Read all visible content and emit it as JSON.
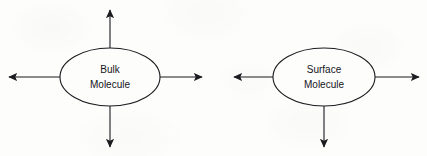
{
  "figure": {
    "kind": "molecular-force-balance-diagram",
    "background_color": "#fdfdfc",
    "stroke_color": "#1b1b20",
    "text_color": "#15151a",
    "stroke_width": 1.1,
    "diagrams": [
      {
        "id": "bulk",
        "name": "bulk-molecule-diagram",
        "ellipse": {
          "cx": 110,
          "cy": 77,
          "rx": 50,
          "ry": 29
        },
        "label_lines": [
          "Bulk",
          "Molecule"
        ],
        "arrow_count": 4,
        "arrows": [
          {
            "name": "arrow-up",
            "direction": "up",
            "x1": 110,
            "y1": 48,
            "x2": 110,
            "y2": 10
          },
          {
            "name": "arrow-right",
            "direction": "right",
            "x1": 160,
            "y1": 77,
            "x2": 202,
            "y2": 77
          },
          {
            "name": "arrow-down",
            "direction": "down",
            "x1": 110,
            "y1": 106,
            "x2": 110,
            "y2": 147
          },
          {
            "name": "arrow-left",
            "direction": "left",
            "x1": 60,
            "y1": 77,
            "x2": 9,
            "y2": 77
          }
        ]
      },
      {
        "id": "surface",
        "name": "surface-molecule-diagram",
        "ellipse": {
          "cx": 324,
          "cy": 77,
          "rx": 51,
          "ry": 29
        },
        "label_lines": [
          "Surface",
          "Molecule"
        ],
        "arrow_count": 3,
        "arrows": [
          {
            "name": "arrow-right",
            "direction": "right",
            "x1": 375,
            "y1": 77,
            "x2": 419,
            "y2": 77
          },
          {
            "name": "arrow-down",
            "direction": "down",
            "x1": 324,
            "y1": 106,
            "x2": 324,
            "y2": 147
          },
          {
            "name": "arrow-left",
            "direction": "left",
            "x1": 273,
            "y1": 77,
            "x2": 234,
            "y2": 77
          }
        ]
      }
    ]
  }
}
